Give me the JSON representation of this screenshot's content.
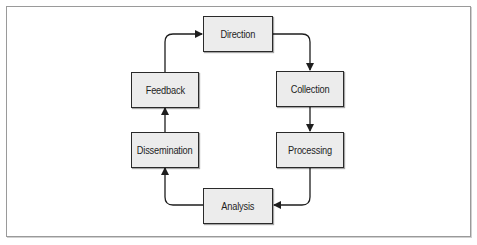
{
  "diagram": {
    "type": "cycle",
    "colors": {
      "node_fill": "#ececec",
      "node_border": "#2a2a2a",
      "edge": "#1e1e1e",
      "frame": "#9a9a9a"
    },
    "nodes": [
      {
        "id": "direction",
        "label": "Direction"
      },
      {
        "id": "collection",
        "label": "Collection"
      },
      {
        "id": "processing",
        "label": "Processing"
      },
      {
        "id": "analysis",
        "label": "Analysis"
      },
      {
        "id": "dissemination",
        "label": "Dissemination"
      },
      {
        "id": "feedback",
        "label": "Feedback"
      }
    ],
    "edges": [
      {
        "from": "direction",
        "to": "collection"
      },
      {
        "from": "collection",
        "to": "processing"
      },
      {
        "from": "processing",
        "to": "analysis"
      },
      {
        "from": "analysis",
        "to": "dissemination"
      },
      {
        "from": "dissemination",
        "to": "feedback"
      },
      {
        "from": "feedback",
        "to": "direction"
      }
    ]
  }
}
